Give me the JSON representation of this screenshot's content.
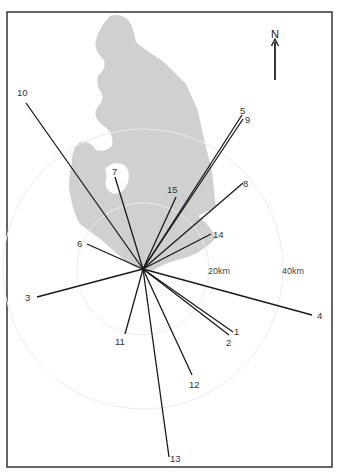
{
  "figure": {
    "north_label": "N",
    "scale_labels": [
      {
        "text": "20km",
        "x": 208,
        "y": 274
      },
      {
        "text": "40km",
        "x": 282,
        "y": 274
      }
    ],
    "colors": {
      "frame": "#333333",
      "land": "#d0d0d0",
      "rays": "#1a1a1a",
      "rings": "#ececec"
    },
    "center": {
      "x": 143,
      "y": 269
    },
    "rings_radius_px": [
      66,
      140
    ],
    "rays": [
      {
        "id": "1",
        "end": [
          233,
          332
        ],
        "label": {
          "text": "1",
          "x": 234,
          "y": 335
        }
      },
      {
        "id": "2",
        "end": [
          229,
          335
        ],
        "label": {
          "text": "2",
          "x": 226,
          "y": 346
        }
      },
      {
        "id": "3",
        "end": [
          37,
          297
        ],
        "label": {
          "text": "3",
          "x": 25,
          "y": 301
        }
      },
      {
        "id": "4",
        "end": [
          312,
          315
        ],
        "label": {
          "text": "4",
          "x": 317,
          "y": 319
        }
      },
      {
        "id": "5",
        "end": [
          242,
          115
        ],
        "label": {
          "text": "5",
          "x": 240,
          "y": 114
        }
      },
      {
        "id": "6",
        "end": [
          87,
          244
        ],
        "label": {
          "text": "6",
          "x": 77,
          "y": 247
        }
      },
      {
        "id": "7",
        "end": [
          115,
          177
        ],
        "label": {
          "text": "7",
          "x": 112,
          "y": 175
        }
      },
      {
        "id": "8",
        "end": [
          243,
          183
        ],
        "label": {
          "text": "8",
          "x": 243,
          "y": 187
        }
      },
      {
        "id": "9",
        "end": [
          243,
          119
        ],
        "label": {
          "text": "9",
          "x": 245,
          "y": 123
        }
      },
      {
        "id": "10",
        "end": [
          26,
          103
        ],
        "label": {
          "text": "10",
          "x": 17,
          "y": 96
        }
      },
      {
        "id": "11",
        "end": [
          125,
          334
        ],
        "label": {
          "text": "11",
          "x": 115,
          "y": 345
        }
      },
      {
        "id": "12",
        "end": [
          192,
          375
        ],
        "label": {
          "text": "12",
          "x": 189,
          "y": 388
        }
      },
      {
        "id": "13",
        "end": [
          169,
          457
        ],
        "label": {
          "text": "13",
          "x": 170,
          "y": 462
        }
      },
      {
        "id": "14",
        "end": [
          211,
          234
        ],
        "label": {
          "text": "14",
          "x": 213,
          "y": 238
        }
      },
      {
        "id": "15",
        "end": [
          176,
          197
        ],
        "label": {
          "text": "15",
          "x": 167,
          "y": 193
        }
      }
    ]
  }
}
